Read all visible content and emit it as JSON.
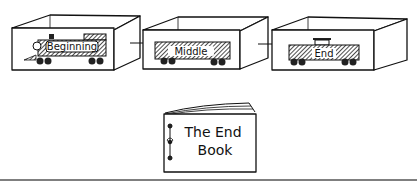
{
  "illustration": {
    "boxes": [
      {
        "id": "beginning",
        "car": "locomotive",
        "label": "Beginning"
      },
      {
        "id": "middle",
        "car": "boxcar",
        "label": "Middle"
      },
      {
        "id": "end",
        "car": "caboose",
        "label": "End"
      }
    ],
    "book": {
      "title_line1": "The End",
      "title_line2": "Book"
    },
    "colors": {
      "ink": "#111111",
      "background": "#ffffff",
      "rule": "#555555"
    }
  }
}
